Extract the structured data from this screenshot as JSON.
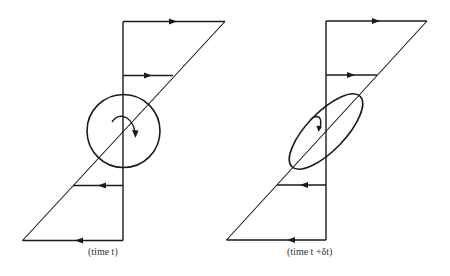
{
  "figure": {
    "panels": [
      {
        "id": "left",
        "caption": "(time t)",
        "vortex_shape": "circle",
        "rotation": "clockwise"
      },
      {
        "id": "right",
        "caption": "(time t +δt)",
        "vortex_shape": "ellipse",
        "rotation": "clockwise"
      }
    ],
    "flow_arrows": [
      "right",
      "right",
      "left",
      "left"
    ]
  },
  "colors": {
    "ink": "#1a1a1a",
    "background": "#ffffff"
  }
}
